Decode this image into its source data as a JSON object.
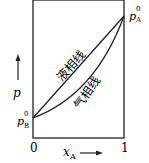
{
  "diagram": {
    "title": "",
    "y_axis_label": "p",
    "x_axis_label": "x",
    "x_axis_label_sub": "A",
    "x_tick_start": "0",
    "x_tick_end": "1",
    "pA_label": "p",
    "pA_sup": "0",
    "pA_sub": "A",
    "pB_label": "p",
    "pB_sup": "0",
    "pB_sub": "B",
    "liquid_line_label": "液相线",
    "vapor_line_label": "气相线",
    "line_color": "#222222"
  }
}
